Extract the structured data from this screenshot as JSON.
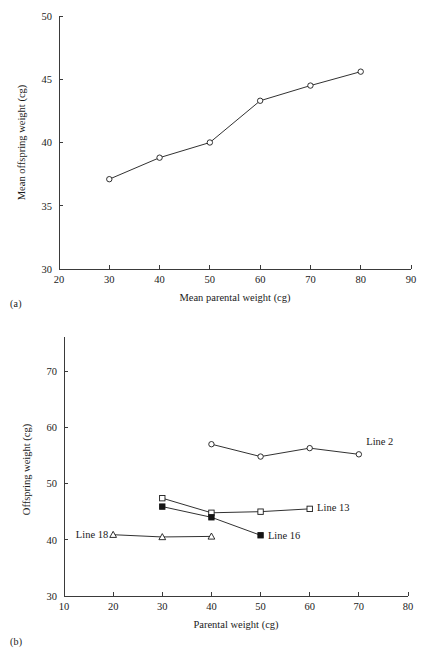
{
  "figure": {
    "panel_a_label": "(a)",
    "panel_b_label": "(b)"
  },
  "chart_data": [
    {
      "panel": "(a)",
      "type": "line",
      "title": "",
      "xlabel": "Mean parental weight (cg)",
      "ylabel": "Mean offspring weight (cg)",
      "xlim": [
        20,
        90
      ],
      "ylim": [
        30,
        50
      ],
      "xticks": [
        20,
        30,
        40,
        50,
        60,
        70,
        80,
        90
      ],
      "xticklabels": [
        "20",
        "30",
        "40",
        "50",
        "60",
        "70",
        "80",
        "90"
      ],
      "yticks": [
        30,
        35,
        40,
        45,
        50
      ],
      "yticklabels": [
        "30",
        "35",
        "40",
        "45",
        "50"
      ],
      "grid": false,
      "legend": "none",
      "series": [
        {
          "name": "mean offspring weight",
          "marker": "open-circle",
          "x": [
            30,
            40,
            50,
            60,
            70,
            80
          ],
          "y": [
            37.1,
            38.8,
            40.0,
            43.3,
            44.5,
            45.6
          ]
        }
      ]
    },
    {
      "panel": "(b)",
      "type": "line",
      "title": "",
      "xlabel": "Parental weight (cg)",
      "ylabel": "Offspring weight (cg)",
      "xlim": [
        10,
        80
      ],
      "ylim": [
        30,
        75
      ],
      "xticks": [
        10,
        20,
        30,
        40,
        50,
        60,
        70,
        80
      ],
      "xticklabels": [
        "10",
        "20",
        "30",
        "40",
        "50",
        "60",
        "70",
        "80"
      ],
      "yticks": [
        30,
        40,
        50,
        60,
        70
      ],
      "yticklabels": [
        "30",
        "40",
        "50",
        "60",
        "70"
      ],
      "grid": false,
      "legend": "inline-labels",
      "series": [
        {
          "name": "Line 2",
          "label": "Line 2",
          "marker": "open-circle",
          "x": [
            40,
            50,
            60,
            70
          ],
          "y": [
            57.0,
            54.8,
            56.3,
            55.2
          ],
          "label_x": 71.5,
          "label_y": 57.6
        },
        {
          "name": "Line 13",
          "label": "Line 13",
          "marker": "open-square",
          "x": [
            30,
            40,
            50,
            60
          ],
          "y": [
            47.4,
            44.8,
            45.0,
            45.5
          ],
          "label_x": 61.5,
          "label_y": 45.8
        },
        {
          "name": "Line 16",
          "label": "Line 16",
          "marker": "filled-square",
          "x": [
            30,
            40,
            50
          ],
          "y": [
            45.9,
            44.0,
            40.8
          ],
          "label_x": 51.5,
          "label_y": 40.9
        },
        {
          "name": "Line 18",
          "label": "Line 18",
          "marker": "open-triangle",
          "x": [
            20,
            30,
            40
          ],
          "y": [
            40.9,
            40.5,
            40.6
          ],
          "label_x": 19.0,
          "label_y": 41.0,
          "label_anchor": "end"
        }
      ]
    }
  ]
}
